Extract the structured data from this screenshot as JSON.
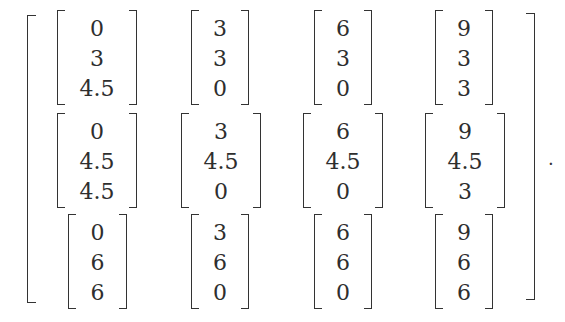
{
  "matrix": {
    "rows": [
      [
        {
          "entries": [
            "0",
            "3",
            "4.5"
          ]
        },
        {
          "entries": [
            "3",
            "3",
            "0"
          ]
        },
        {
          "entries": [
            "6",
            "3",
            "0"
          ]
        },
        {
          "entries": [
            "9",
            "3",
            "3"
          ]
        }
      ],
      [
        {
          "entries": [
            "0",
            "4.5",
            "4.5"
          ]
        },
        {
          "entries": [
            "3",
            "4.5",
            "0"
          ]
        },
        {
          "entries": [
            "6",
            "4.5",
            "0"
          ]
        },
        {
          "entries": [
            "9",
            "4.5",
            "3"
          ]
        }
      ],
      [
        {
          "entries": [
            "0",
            "6",
            "6"
          ]
        },
        {
          "entries": [
            "3",
            "6",
            "0"
          ]
        },
        {
          "entries": [
            "6",
            "6",
            "0"
          ]
        },
        {
          "entries": [
            "9",
            "6",
            "6"
          ]
        }
      ]
    ],
    "trailing_punctuation": "."
  }
}
